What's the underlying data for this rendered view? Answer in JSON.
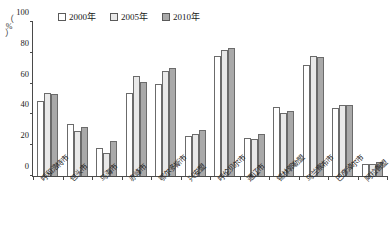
{
  "chart_data": {
    "type": "bar",
    "title": "",
    "subtitle": "",
    "xlabel": "",
    "ylabel": "（%）",
    "ylim": [
      0,
      100
    ],
    "yticks": [
      0,
      20,
      40,
      60,
      80,
      100
    ],
    "grid": false,
    "legend_position": "top-center",
    "categories": [
      "呼和浩特市",
      "包头市",
      "乌海市",
      "赤峰市",
      "鄂尔多斯市",
      "兴安盟",
      "呼伦贝尔市",
      "通辽市",
      "锡林郭勒盟",
      "乌兰察布市",
      "巴彦淖尔市",
      "阿拉善盟"
    ],
    "series": [
      {
        "name": "2000年",
        "color": "#ffffff",
        "values": [
          49,
          34,
          18,
          54,
          60,
          26,
          78,
          25,
          45,
          72,
          44,
          8
        ]
      },
      {
        "name": "2005年",
        "color": "#e9e9e9",
        "values": [
          54,
          29,
          15,
          65,
          68,
          27,
          82,
          24,
          41,
          78,
          46,
          8
        ]
      },
      {
        "name": "2010年",
        "color": "#a9a9a9",
        "values": [
          53,
          32,
          23,
          61,
          70,
          30,
          83,
          27,
          42,
          77,
          46,
          9
        ]
      }
    ]
  },
  "axis": {
    "unit_open_paren": "（",
    "unit_symbol": "%",
    "unit_close_paren": "）"
  }
}
